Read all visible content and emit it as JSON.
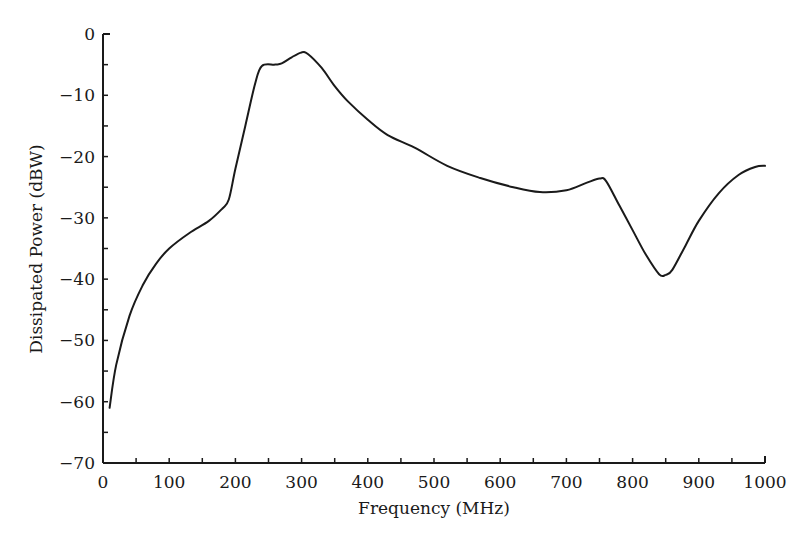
{
  "chart_data": {
    "type": "line",
    "title": "",
    "xlabel": "Frequency (MHz)",
    "ylabel": "Dissipated Power (dBW)",
    "xlim": [
      0,
      1000
    ],
    "ylim": [
      -70,
      0
    ],
    "grid": false,
    "legend": null,
    "x_ticks": [
      0,
      100,
      200,
      300,
      400,
      500,
      600,
      700,
      800,
      900,
      1000
    ],
    "x_tick_labels": [
      "0",
      "100",
      "200",
      "300",
      "400",
      "500",
      "600",
      "700",
      "800",
      "900",
      "1000"
    ],
    "y_ticks": [
      0,
      -10,
      -20,
      -30,
      -40,
      -50,
      -60,
      -70
    ],
    "y_tick_labels": [
      "0",
      "−10",
      "−20",
      "−30",
      "−40",
      "−50",
      "−60",
      "−70"
    ],
    "series": [
      {
        "name": "Dissipated Power",
        "x": [
          10,
          20,
          40,
          60,
          80,
          100,
          130,
          160,
          180,
          190,
          200,
          215,
          230,
          240,
          260,
          270,
          285,
          300,
          310,
          330,
          350,
          370,
          400,
          430,
          470,
          520,
          570,
          620,
          660,
          700,
          730,
          750,
          760,
          780,
          800,
          820,
          840,
          850,
          860,
          880,
          900,
          930,
          960,
          985,
          1000
        ],
        "values": [
          -61,
          -54,
          -46,
          -41,
          -37.5,
          -35,
          -32.5,
          -30.5,
          -28.5,
          -27,
          -22,
          -15,
          -8,
          -5.2,
          -5,
          -4.8,
          -3.8,
          -3,
          -3.3,
          -5.5,
          -8.5,
          -11,
          -14,
          -16.5,
          -18.5,
          -21.5,
          -23.5,
          -25,
          -25.8,
          -25.5,
          -24.3,
          -23.6,
          -24,
          -28,
          -32,
          -36,
          -39.2,
          -39.3,
          -38.5,
          -34.5,
          -30.5,
          -26,
          -23,
          -21.7,
          -21.5
        ]
      }
    ]
  }
}
